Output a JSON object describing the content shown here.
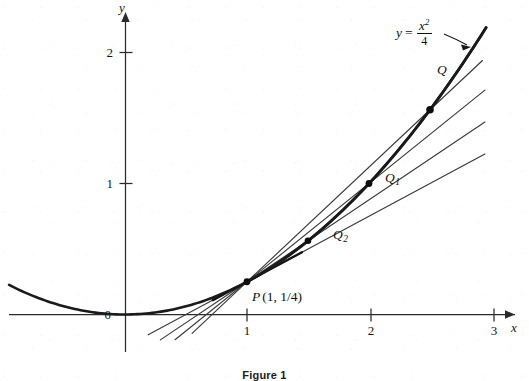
{
  "figure": {
    "caption": "Figure 1",
    "equation": {
      "lhs": "y",
      "equals": "=",
      "numerator": "x",
      "numerator_exponent": "2",
      "denominator": "4",
      "full_text": "y = x^2/4"
    },
    "axes": {
      "x_axis_name": "x",
      "y_axis_name": "y",
      "origin_label": "0",
      "x_ticks": [
        {
          "label": "1",
          "value": 1
        },
        {
          "label": "2",
          "value": 2
        },
        {
          "label": "3",
          "value": 3
        }
      ],
      "y_ticks": [
        {
          "label": "1",
          "value": 1
        },
        {
          "label": "2",
          "value": 2
        }
      ]
    },
    "points": [
      {
        "name": "P",
        "label": "P",
        "coords_text": "(1, 1/4)",
        "subscript": "",
        "x": 1,
        "y": 0.25
      },
      {
        "name": "Q2",
        "label": "Q",
        "coords_text": "",
        "subscript": "2",
        "x": 1.5,
        "y": 0.5625
      },
      {
        "name": "Q1",
        "label": "Q",
        "coords_text": "",
        "subscript": "1",
        "x": 2,
        "y": 1.0
      },
      {
        "name": "Q",
        "label": "Q",
        "coords_text": "",
        "subscript": "",
        "x": 2.5,
        "y": 1.5625
      }
    ]
  },
  "chart_data": {
    "type": "line",
    "title": "Figure 1",
    "xlabel": "x",
    "ylabel": "y",
    "xlim": [
      -0.95,
      3.3
    ],
    "ylim": [
      -0.5,
      2.35
    ],
    "grid": false,
    "legend": null,
    "series": [
      {
        "name": "parabola",
        "kind": "curve",
        "equation": "y = x^2/4",
        "x": [
          -0.95,
          -0.5,
          0,
          0.5,
          1,
          1.5,
          2,
          2.5,
          2.95
        ],
        "values": [
          0.2256,
          0.0625,
          0,
          0.0625,
          0.25,
          0.5625,
          1.0,
          1.5625,
          2.1756
        ]
      },
      {
        "name": "secant-PQ",
        "kind": "line",
        "through": [
          [
            1,
            0.25
          ],
          [
            2.5,
            1.5625
          ]
        ],
        "slope": 0.875
      },
      {
        "name": "secant-PQ1",
        "kind": "line",
        "through": [
          [
            1,
            0.25
          ],
          [
            2,
            1.0
          ]
        ],
        "slope": 0.75
      },
      {
        "name": "secant-PQ2",
        "kind": "line",
        "through": [
          [
            1,
            0.25
          ],
          [
            1.5,
            0.5625
          ]
        ],
        "slope": 0.625
      },
      {
        "name": "tangent-at-P",
        "kind": "line",
        "through": [
          [
            1,
            0.25
          ]
        ],
        "slope": 0.5
      }
    ],
    "annotations": [
      {
        "text": "y = x^2/4",
        "x": 2.45,
        "y": 2.25
      },
      {
        "text": "P (1, 1/4)",
        "x": 1.05,
        "y": 0.12
      },
      {
        "text": "Q2",
        "x": 1.58,
        "y": 0.6
      },
      {
        "text": "Q1",
        "x": 2.08,
        "y": 1.05
      },
      {
        "text": "Q",
        "x": 2.45,
        "y": 1.72
      }
    ]
  }
}
